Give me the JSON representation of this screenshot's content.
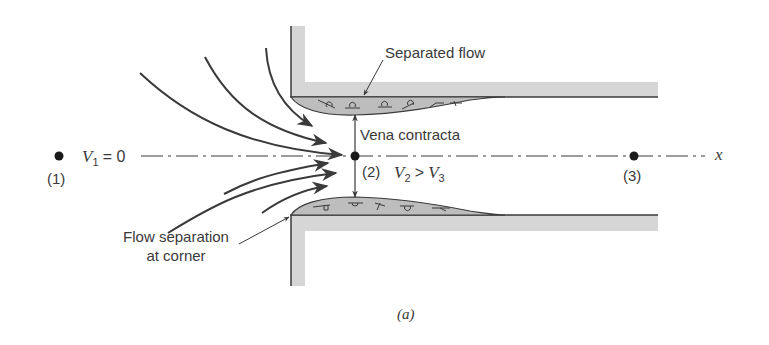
{
  "figure": {
    "caption": "(a)",
    "colors": {
      "wall_fill": "#d6d6d6",
      "separated_fill": "#bdbdbd",
      "line": "#3a3a3a",
      "background": "#ffffff"
    }
  },
  "labels": {
    "separated_flow": "Separated flow",
    "vena_contracta": "Vena contracta",
    "flow_separation_line1": "Flow separation",
    "flow_separation_line2": "at corner",
    "axis_x": "x"
  },
  "points": [
    {
      "id": "p1",
      "label": "(1)",
      "velocity_symbol": "V",
      "velocity_sub": "1",
      "velocity_rel": "= 0"
    },
    {
      "id": "p2",
      "label": "(2)",
      "velocity_symbol": "V",
      "velocity_sub": "2",
      "velocity_rel": ">",
      "compare_symbol": "V",
      "compare_sub": "3"
    },
    {
      "id": "p3",
      "label": "(3)"
    }
  ]
}
